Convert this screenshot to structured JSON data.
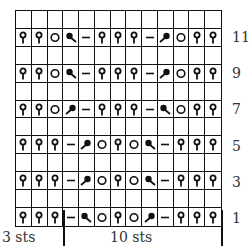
{
  "chart_title": "",
  "columns": 13,
  "rows_total": 12,
  "row_numbers": [
    {
      "label": "11",
      "row_index": 1
    },
    {
      "label": "9",
      "row_index": 3
    },
    {
      "label": "7",
      "row_index": 5
    },
    {
      "label": "5",
      "row_index": 7
    },
    {
      "label": "3",
      "row_index": 9
    },
    {
      "label": "1",
      "row_index": 11
    }
  ],
  "grid": [
    [
      "",
      "",
      "",
      "",
      "",
      "",
      "",
      "",
      "",
      "",
      "",
      "",
      ""
    ],
    [
      "tp",
      "tp",
      "yo",
      "ld",
      "p",
      "tp",
      "tp",
      "tp",
      "p",
      "rd",
      "yo",
      "tp",
      "tp"
    ],
    [
      "",
      "",
      "",
      "",
      "",
      "",
      "",
      "",
      "",
      "",
      "",
      "",
      ""
    ],
    [
      "tp",
      "tp",
      "yo",
      "ld",
      "p",
      "tp",
      "tp",
      "tp",
      "p",
      "rd",
      "yo",
      "tp",
      "tp"
    ],
    [
      "",
      "",
      "",
      "",
      "",
      "",
      "",
      "",
      "",
      "",
      "",
      "",
      ""
    ],
    [
      "tp",
      "tp",
      "yo",
      "rd",
      "p",
      "tp",
      "tp",
      "tp",
      "p",
      "ld",
      "yo",
      "tp",
      "tp"
    ],
    [
      "",
      "",
      "",
      "",
      "",
      "",
      "",
      "",
      "",
      "",
      "",
      "",
      ""
    ],
    [
      "tp",
      "tp",
      "tp",
      "p",
      "rd",
      "yo",
      "tp",
      "yo",
      "ld",
      "p",
      "tp",
      "tp",
      "tp"
    ],
    [
      "",
      "",
      "",
      "",
      "",
      "",
      "",
      "",
      "",
      "",
      "",
      "",
      ""
    ],
    [
      "tp",
      "tp",
      "tp",
      "p",
      "rd",
      "yo",
      "tp",
      "yo",
      "ld",
      "p",
      "tp",
      "tp",
      "tp"
    ],
    [
      "",
      "",
      "",
      "",
      "",
      "",
      "",
      "",
      "",
      "",
      "",
      "",
      ""
    ],
    [
      "tp",
      "tp",
      "tp",
      "p",
      "ld",
      "yo",
      "tp",
      "yo",
      "rd",
      "p",
      "tp",
      "tp",
      "tp"
    ]
  ],
  "legend_symbols": {
    "tp": "twisted-stitch-icon",
    "yo": "yarn-over-icon",
    "ld": "left-leaning-decrease-icon",
    "rd": "right-leaning-decrease-icon",
    "p": "purl-dash-icon"
  },
  "repeat_labels": {
    "edge": "3 sts",
    "repeat": "10 sts"
  },
  "colors": {
    "ink": "#111111",
    "text": "#333333",
    "background": "#ffffff"
  }
}
